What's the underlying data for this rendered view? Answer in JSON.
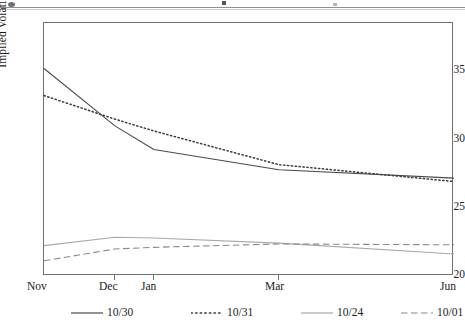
{
  "figure": {
    "background": "#ffffff",
    "frame_color": "#707070",
    "text_color": "#1c1c1c"
  },
  "axis": {
    "ylabel": "Implied Volatility (%)",
    "yticks": [
      "20",
      "25",
      "30",
      "35"
    ],
    "xticks": [
      "Nov",
      "Dec",
      "Jan",
      "Mar",
      "Jun"
    ]
  },
  "legend": {
    "items": [
      {
        "label": "10/30",
        "style": "solid",
        "color": "#4a4a4a"
      },
      {
        "label": "10/31",
        "style": "dotted",
        "color": "#3a3a3a"
      },
      {
        "label": "10/24",
        "style": "solid",
        "color": "#a8a8a8"
      },
      {
        "label": "10/01",
        "style": "dashed",
        "color": "#8a8a8a"
      }
    ]
  },
  "chart_data": {
    "type": "line",
    "title": "",
    "xlabel": "",
    "ylabel": "Implied Volatility (%)",
    "x": [
      "Nov",
      "Dec",
      "Jan",
      "Mar",
      "Jun"
    ],
    "x_positions": [
      0,
      17.3,
      26.8,
      57.3,
      100
    ],
    "xlim": [
      0,
      100
    ],
    "ylim": [
      20,
      35
    ],
    "ytick_values": [
      20,
      25,
      30,
      35
    ],
    "grid": false,
    "legend_position": "below",
    "series": [
      {
        "name": "10/30",
        "style": "solid",
        "color": "#4a4a4a",
        "values": [
          32.3,
          28.9,
          27.5,
          26.3,
          25.8
        ]
      },
      {
        "name": "10/31",
        "style": "dotted",
        "color": "#3a3a3a",
        "values": [
          30.7,
          29.3,
          28.6,
          26.6,
          25.6
        ]
      },
      {
        "name": "10/24",
        "style": "solid",
        "color": "#a8a8a8",
        "values": [
          21.8,
          22.3,
          22.25,
          21.95,
          21.3
        ]
      },
      {
        "name": "10/01",
        "style": "dashed",
        "color": "#8a8a8a",
        "values": [
          20.9,
          21.6,
          21.7,
          21.9,
          21.85
        ]
      }
    ]
  }
}
